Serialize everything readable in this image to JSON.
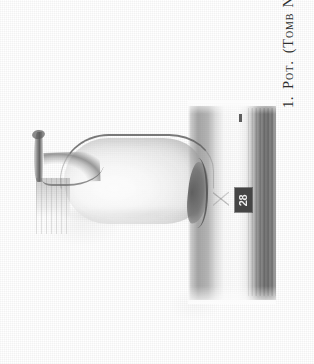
{
  "plate": {
    "caption": {
      "figure_number": "1.",
      "object_label": "Pot.",
      "provenance_open_paren": "(",
      "provenance_label": "Tomb",
      "provenance_number_label": "No.",
      "provenance_number": "28",
      "provenance_close_paren": ")",
      "full_text": "1. Pot. (Tomb No. 28)",
      "orientation": "rotated-90-ccw"
    },
    "photo": {
      "subject": "pot",
      "number_tag": "28",
      "background_description": "studio backdrop with light and dark vertical bands",
      "tone": "monochrome halftone"
    },
    "colors": {
      "page_background": "#ffffff",
      "caption_text": "#2e2e2e",
      "tag_background": "#3e3e3e",
      "tag_text": "#f0f0f0"
    }
  }
}
